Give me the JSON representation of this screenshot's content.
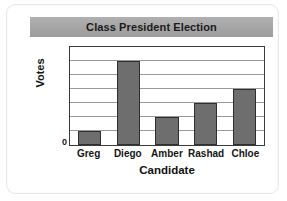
{
  "card": {
    "background_color": "#ffffff",
    "border_color": "#e9e9e9"
  },
  "title": {
    "text": "Class President Election",
    "band_color": "#a5a5a5",
    "text_color": "#1b1b1b"
  },
  "axes": {
    "y_title": "Votes",
    "x_title": "Candidate",
    "y_origin_label": "0"
  },
  "chart_data": {
    "type": "bar",
    "title": "Class President Election",
    "xlabel": "Candidate",
    "ylabel": "Votes",
    "categories": [
      "Greg",
      "Diego",
      "Amber",
      "Rashad",
      "Chloe"
    ],
    "values": [
      1,
      6,
      2,
      3,
      4
    ],
    "ylim": [
      0,
      7
    ],
    "y_tick_labels": [
      "0"
    ],
    "gridlines": true,
    "gridline_count": 6,
    "legend": null,
    "bar_color": "#6e6e6e",
    "bar_border_color": "#2f2f2f",
    "plot_border_color": "#3a3a3a",
    "gridline_color": "#9a9a9a"
  }
}
